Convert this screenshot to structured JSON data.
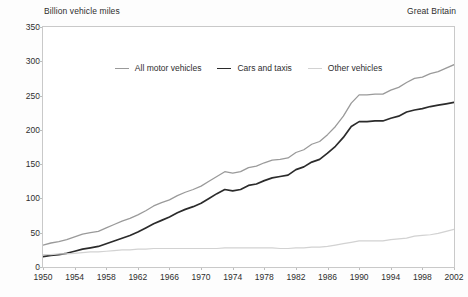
{
  "header": {
    "y_axis_title": "Billion vehicle miles",
    "region": "Great Britain"
  },
  "legend": {
    "position": "top-center-inside",
    "items": [
      {
        "label": "All motor vehicles",
        "color": "#9a9a9a"
      },
      {
        "label": "Cars and taxis",
        "color": "#2b2b2b"
      },
      {
        "label": "Other vehicles",
        "color": "#d2d2d2"
      }
    ]
  },
  "axes": {
    "y_ticks": [
      "350",
      "300",
      "250",
      "200",
      "150",
      "100",
      "50",
      "0"
    ],
    "x_ticks": [
      "1950",
      "1954",
      "1958",
      "1962",
      "1966",
      "1970",
      "1974",
      "1978",
      "1982",
      "1986",
      "1990",
      "1994",
      "1998",
      "2002"
    ]
  },
  "colors": {
    "all_motor_vehicles": "#9a9a9a",
    "cars_and_taxis": "#2b2b2b",
    "other_vehicles": "#d2d2d2",
    "frame": "#c9c9c9",
    "text": "#2e2e2e",
    "background": "#fdfdfd"
  },
  "chart_data": {
    "type": "line",
    "title": "",
    "subtitle": "",
    "xlabel": "",
    "ylabel": "Billion vehicle miles",
    "annotation_region": "Great Britain",
    "xlim": [
      1950,
      2002
    ],
    "ylim": [
      0,
      350
    ],
    "y_tick_step": 50,
    "x_tick_step": 4,
    "grid": false,
    "legend_position": "top-center-inside",
    "x": [
      1950,
      1951,
      1952,
      1953,
      1954,
      1955,
      1956,
      1957,
      1958,
      1959,
      1960,
      1961,
      1962,
      1963,
      1964,
      1965,
      1966,
      1967,
      1968,
      1969,
      1970,
      1971,
      1972,
      1973,
      1974,
      1975,
      1976,
      1977,
      1978,
      1979,
      1980,
      1981,
      1982,
      1983,
      1984,
      1985,
      1986,
      1987,
      1988,
      1989,
      1990,
      1991,
      1992,
      1993,
      1994,
      1995,
      1996,
      1997,
      1998,
      1999,
      2000,
      2001,
      2002
    ],
    "series": [
      {
        "name": "All motor vehicles",
        "color": "#9a9a9a",
        "values": [
          32,
          35,
          37,
          40,
          44,
          48,
          50,
          52,
          57,
          62,
          67,
          71,
          76,
          82,
          89,
          94,
          98,
          104,
          109,
          113,
          118,
          125,
          132,
          139,
          137,
          139,
          145,
          147,
          152,
          156,
          157,
          159,
          167,
          171,
          179,
          183,
          193,
          205,
          220,
          239,
          251,
          251,
          252,
          252,
          258,
          262,
          269,
          275,
          277,
          282,
          285,
          290,
          295
        ]
      },
      {
        "name": "Cars and taxis",
        "color": "#2b2b2b",
        "values": [
          15,
          17,
          18,
          20,
          23,
          26,
          28,
          30,
          34,
          38,
          42,
          46,
          51,
          57,
          63,
          68,
          73,
          79,
          84,
          88,
          93,
          100,
          107,
          113,
          111,
          113,
          119,
          121,
          126,
          130,
          132,
          134,
          142,
          146,
          153,
          157,
          166,
          176,
          189,
          205,
          212,
          212,
          213,
          213,
          217,
          220,
          226,
          229,
          231,
          234,
          236,
          238,
          240
        ]
      },
      {
        "name": "Other vehicles",
        "color": "#d2d2d2",
        "values": [
          18,
          18,
          19,
          19,
          20,
          21,
          22,
          22,
          23,
          24,
          25,
          25,
          26,
          26,
          27,
          27,
          27,
          27,
          27,
          27,
          27,
          27,
          27,
          28,
          28,
          28,
          28,
          28,
          28,
          28,
          27,
          27,
          28,
          28,
          29,
          29,
          30,
          32,
          34,
          36,
          38,
          38,
          38,
          38,
          40,
          41,
          42,
          45,
          46,
          47,
          49,
          52,
          55
        ]
      }
    ]
  }
}
